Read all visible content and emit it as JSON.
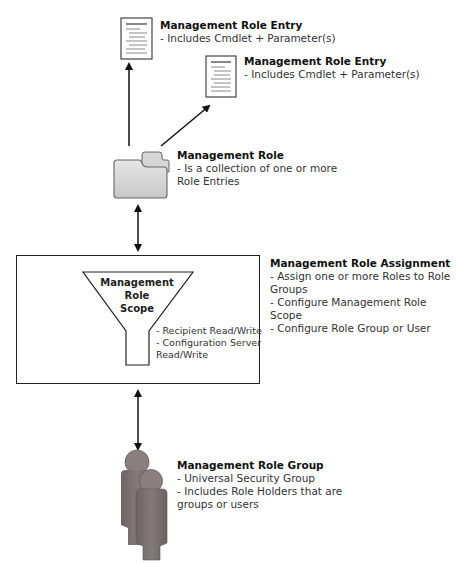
{
  "diagram": {
    "role_entry_1": {
      "title": "Management Role Entry",
      "lines": [
        "- Includes Cmdlet + Parameter(s)"
      ]
    },
    "role_entry_2": {
      "title": "Management Role Entry",
      "lines": [
        "- Includes Cmdlet + Parameter(s)"
      ]
    },
    "role": {
      "title": "Management Role",
      "lines": [
        "- Is a collection of one or more",
        "Role Entries"
      ]
    },
    "role_assignment": {
      "title": "Management Role Assignment",
      "lines": [
        "- Assign one or more Roles to Role",
        "Groups",
        "- Configure Management Role Scope",
        "- Configure Role Group or User"
      ]
    },
    "role_scope": {
      "title_line1": "Management Role",
      "title_line2": "Scope",
      "notes": [
        "- Recipient Read/Write",
        "- Configuration Server",
        "Read/Write"
      ]
    },
    "role_group": {
      "title": "Management Role Group",
      "lines": [
        "- Universal Security Group",
        "- Includes Role Holders that are",
        "groups or users"
      ]
    },
    "icons": {
      "document": "document-icon",
      "folder": "folder-icon",
      "funnel": "funnel-icon",
      "people": "people-icon"
    },
    "colors": {
      "line": "#222222",
      "folder_fill": "#d9d9d9",
      "person_fill": "#7a7070"
    }
  }
}
